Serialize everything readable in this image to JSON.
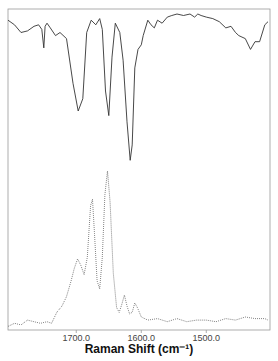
{
  "chart_data": {
    "type": "line",
    "title": "",
    "xlabel": "Raman Shift (cm⁻¹)",
    "ylabel": "",
    "xlim": [
      1805,
      1402
    ],
    "x_reversed": true,
    "grid": false,
    "legend": null,
    "xticks": [
      {
        "value": 1700,
        "label": "1700.0"
      },
      {
        "value": 1600,
        "label": "1600.0"
      },
      {
        "value": 1500,
        "label": "1500.0"
      }
    ],
    "series": [
      {
        "name": "upper spectrum (solid)",
        "style": "solid",
        "color": "#333333",
        "x": [
          1805,
          1795,
          1785,
          1775,
          1765,
          1758,
          1753,
          1750,
          1748,
          1745,
          1740,
          1732,
          1725,
          1715,
          1705,
          1697,
          1690,
          1684,
          1677,
          1670,
          1664,
          1660,
          1655,
          1650,
          1645,
          1640,
          1633,
          1628,
          1622,
          1617,
          1614,
          1610,
          1605,
          1600,
          1597,
          1590,
          1585,
          1580,
          1575,
          1568,
          1560,
          1553,
          1545,
          1535,
          1525,
          1518,
          1513,
          1508,
          1500,
          1490,
          1480,
          1470,
          1462,
          1455,
          1450,
          1445,
          1440,
          1432,
          1425,
          1418,
          1410,
          1405
        ],
        "y": [
          0.96,
          0.93,
          0.88,
          0.89,
          0.92,
          0.93,
          0.9,
          0.78,
          0.92,
          0.94,
          0.91,
          0.86,
          0.88,
          0.84,
          0.55,
          0.37,
          0.45,
          0.88,
          0.96,
          0.93,
          0.97,
          0.9,
          0.5,
          0.34,
          0.72,
          0.94,
          0.88,
          0.7,
          0.3,
          0.05,
          0.15,
          0.65,
          0.77,
          0.8,
          0.86,
          0.96,
          0.93,
          0.91,
          0.96,
          0.94,
          0.98,
          0.99,
          1.0,
          0.99,
          1.0,
          0.98,
          1.0,
          0.99,
          0.98,
          0.97,
          0.95,
          0.91,
          0.92,
          0.88,
          0.86,
          0.85,
          0.84,
          0.77,
          0.82,
          0.82,
          0.93,
          0.95
        ]
      },
      {
        "name": "lower spectrum (dotted)",
        "style": "dotted",
        "color": "#555555",
        "x": [
          1805,
          1795,
          1785,
          1775,
          1765,
          1755,
          1745,
          1738,
          1730,
          1722,
          1715,
          1708,
          1703,
          1698,
          1693,
          1688,
          1683,
          1678,
          1675,
          1672,
          1668,
          1664,
          1660,
          1656,
          1652,
          1648,
          1643,
          1638,
          1634,
          1630,
          1626,
          1622,
          1618,
          1614,
          1610,
          1606,
          1600,
          1590,
          1575,
          1560,
          1545,
          1530,
          1515,
          1500,
          1485,
          1470,
          1455,
          1440,
          1425,
          1410,
          1405
        ],
        "y": [
          0.01,
          0.03,
          0.02,
          0.05,
          0.04,
          0.03,
          0.04,
          0.03,
          0.1,
          0.14,
          0.2,
          0.3,
          0.38,
          0.44,
          0.4,
          0.34,
          0.45,
          0.78,
          0.82,
          0.6,
          0.3,
          0.25,
          0.45,
          0.85,
          1.0,
          0.8,
          0.35,
          0.13,
          0.1,
          0.15,
          0.21,
          0.14,
          0.09,
          0.1,
          0.16,
          0.13,
          0.07,
          0.05,
          0.06,
          0.04,
          0.06,
          0.04,
          0.05,
          0.05,
          0.04,
          0.06,
          0.05,
          0.07,
          0.06,
          0.06,
          0.05
        ]
      }
    ]
  }
}
